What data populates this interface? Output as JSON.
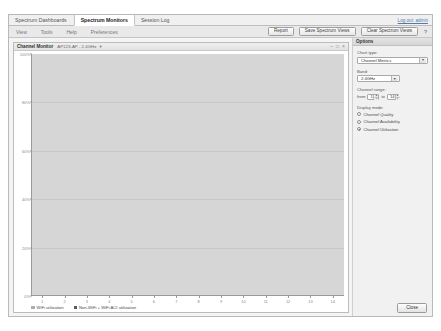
{
  "nav": {
    "tabs": [
      {
        "label": "Spectrum Dashboards",
        "active": false
      },
      {
        "label": "Spectrum Monitors",
        "active": true
      },
      {
        "label": "Session Log",
        "active": false
      }
    ],
    "logout": "Log out: admin"
  },
  "toolbar": {
    "menus": [
      "View",
      "Tools",
      "Help",
      "Preferences"
    ],
    "buttons": [
      {
        "label": "Report"
      },
      {
        "label": "Save Spectrum Views"
      },
      {
        "label": "Clear Spectrum Views"
      }
    ],
    "help_icon": "?"
  },
  "panel": {
    "title": "Channel Monitor",
    "subtitle": "AP123-AP - 2.4GHz",
    "caret_icon": "chevron-down-icon",
    "minimize_icon": "–",
    "maximize_icon": "□",
    "close_icon": "×"
  },
  "options": {
    "header": "Options",
    "chart_type_label": "Chart type:",
    "chart_type_value": "Channel Metrics",
    "band_label": "Band:",
    "band_value": "2.4GHz",
    "channel_range_label": "Channel range:",
    "from_label": "from",
    "to_label": "to",
    "range_from": "1",
    "range_to": "14",
    "spin_up": "▲",
    "spin_down": "▼",
    "display_mode_label": "Display mode:",
    "modes": [
      {
        "label": "Channel Quality",
        "selected": false
      },
      {
        "label": "Channel Availability",
        "selected": false
      },
      {
        "label": "Channel Utilization",
        "selected": true
      }
    ],
    "close_label": "Close"
  },
  "chart_data": {
    "type": "bar",
    "subtype": "stacked",
    "title": "Channel Monitor",
    "xlabel": "",
    "ylabel": "",
    "ylim": [
      0,
      100
    ],
    "grid": true,
    "legend_position": "bottom-left",
    "categories": [
      "1",
      "2",
      "3",
      "4",
      "5",
      "6",
      "7",
      "8",
      "9",
      "10",
      "11",
      "12",
      "13",
      "14"
    ],
    "ytick_labels": [
      "100%",
      "80%",
      "60%",
      "40%",
      "20%",
      "0%"
    ],
    "ytick_values": [
      100,
      80,
      60,
      40,
      20,
      0
    ],
    "series": [
      {
        "name": "WiFi utilization",
        "color": "#adadad",
        "values": [
          60,
          40,
          15,
          15,
          28,
          26,
          29,
          26,
          29,
          38,
          44,
          29,
          12,
          0
        ]
      },
      {
        "name": "Non-WiFi + WiFi ACI utilization",
        "color": "#5c5c5c",
        "values": [
          33,
          37,
          26,
          22,
          8,
          5,
          5,
          10,
          10,
          10,
          10,
          9,
          5,
          5
        ]
      }
    ]
  }
}
